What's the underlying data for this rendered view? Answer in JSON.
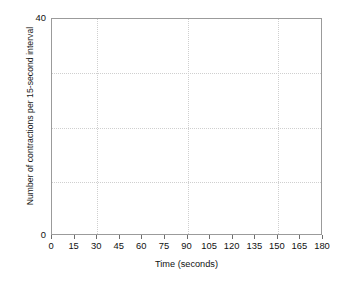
{
  "chart_data": {
    "type": "line",
    "title": "",
    "subtitle": "",
    "xlabel": "Time (seconds)",
    "ylabel": "Number of contractions per 15-second interval",
    "xlim": [
      0,
      180
    ],
    "ylim": [
      0,
      40
    ],
    "x_ticks": [
      0,
      15,
      30,
      45,
      60,
      75,
      90,
      105,
      120,
      135,
      150,
      165,
      180
    ],
    "x_tick_labels": [
      "0",
      "15",
      "30",
      "45",
      "60",
      "75",
      "90",
      "105",
      "120",
      "135",
      "150",
      "165",
      "180"
    ],
    "y_ticks": [
      0,
      40
    ],
    "y_tick_labels": [
      "0",
      "40"
    ],
    "grid": true,
    "grid_style": "dotted",
    "grid_color": "#cfcfcf",
    "x_gridlines": [
      30,
      90,
      150
    ],
    "y_gridlines": [
      10,
      20,
      30
    ],
    "legend": null,
    "legend_position": "none",
    "series": [],
    "annotations": [],
    "frame_color": "#9b9b9b",
    "background_color": "#ffffff",
    "text_color": "#111111"
  }
}
